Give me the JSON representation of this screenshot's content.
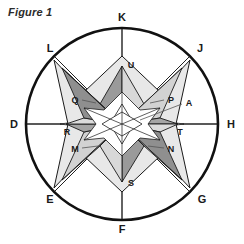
{
  "figure": {
    "caption": "Figure 1",
    "type": "compass-rose-star-diagram"
  },
  "colors": {
    "stroke": "#1a1a1a",
    "background": "#ffffff",
    "facet_dark": "#8c8c8c",
    "facet_mid": "#b3b3b3",
    "facet_light": "#d9d9d9",
    "facet_white": "#ffffff",
    "outline_light": "#e0e0e0",
    "leader_line": "#555555",
    "label_color": "#1a1a1a"
  },
  "outer_labels": [
    {
      "id": "K",
      "text": "K",
      "angle_deg": 90,
      "position": "top"
    },
    {
      "id": "J",
      "text": "J",
      "angle_deg": 45,
      "position": "top-right"
    },
    {
      "id": "H",
      "text": "H",
      "angle_deg": 0,
      "position": "right"
    },
    {
      "id": "G",
      "text": "G",
      "angle_deg": -45,
      "position": "bottom-right"
    },
    {
      "id": "F",
      "text": "F",
      "angle_deg": -90,
      "position": "bottom"
    },
    {
      "id": "E",
      "text": "E",
      "angle_deg": -135,
      "position": "bottom-left"
    },
    {
      "id": "D",
      "text": "D",
      "angle_deg": 180,
      "position": "left"
    },
    {
      "id": "L",
      "text": "L",
      "angle_deg": 135,
      "position": "top-left"
    }
  ],
  "inner_labels": [
    {
      "id": "U",
      "text": "U",
      "position": "top-spike"
    },
    {
      "id": "Q",
      "text": "Q",
      "position": "upper-left-facet"
    },
    {
      "id": "P",
      "text": "P",
      "position": "upper-right-facet"
    },
    {
      "id": "A",
      "text": "A",
      "position": "upper-right-outer"
    },
    {
      "id": "R",
      "text": "R",
      "position": "left-spike"
    },
    {
      "id": "T",
      "text": "T",
      "position": "right-spike"
    },
    {
      "id": "M",
      "text": "M",
      "position": "lower-left-facet"
    },
    {
      "id": "N",
      "text": "N",
      "position": "lower-right-facet"
    },
    {
      "id": "S",
      "text": "S",
      "position": "bottom-spike"
    }
  ],
  "geometry": {
    "center_x": 122,
    "center_y": 124,
    "circle_radius": 96,
    "star_points": 6,
    "axis_count": 8,
    "notes": "outer circle with eight radial lines to labels D, E, F, G, H, J, K, L; faceted six-point star at center"
  }
}
